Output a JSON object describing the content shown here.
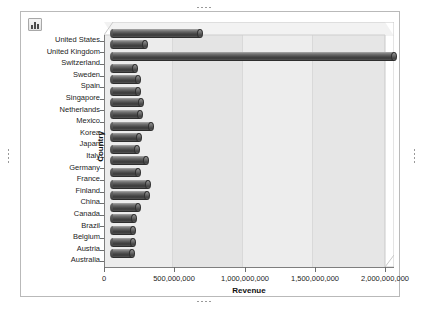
{
  "window": {
    "background_color": "#ffffff"
  },
  "toolbar": {
    "chart_type_button_name": "chart-icon",
    "chart_type_button_tooltip": "Chart"
  },
  "handles": {
    "top": "top-resize-handle",
    "bottom": "bottom-resize-handle",
    "left": "left-resize-handle",
    "right": "right-resize-handle"
  },
  "colors": {
    "bar_dark": "#3a3a3a",
    "bar_light": "#8b8b8b",
    "plot_wall": "#e8e8e8",
    "axis": "#7e7e7e",
    "frame_border": "#b9b9b9",
    "text": "#1d1d1d"
  },
  "chart_data": {
    "type": "bar",
    "orientation": "horizontal",
    "title": "",
    "xlabel": "Revenue",
    "ylabel": "Country",
    "xlim": [
      0,
      2000000000
    ],
    "grid": true,
    "legend": "none",
    "xticks": [
      0,
      500000000,
      1000000000,
      1500000000,
      2000000000
    ],
    "xtick_labels": [
      "0",
      "500,000,000",
      "1,000,000,000",
      "1,500,000,000",
      "2,000,000,000"
    ],
    "categories": [
      "United States",
      "United Kingdom",
      "Switzerland",
      "Sweden",
      "Spain",
      "Singapore",
      "Netherlands",
      "Mexico",
      "Korea",
      "Japan",
      "Italy",
      "Germany",
      "France",
      "Finland",
      "China",
      "Canada",
      "Brazil",
      "Belgium",
      "Austria",
      "Australia"
    ],
    "values": [
      620000000,
      230000000,
      2000000000,
      160000000,
      180000000,
      175000000,
      200000000,
      190000000,
      270000000,
      185000000,
      170000000,
      235000000,
      175000000,
      250000000,
      245000000,
      180000000,
      150000000,
      145000000,
      140000000,
      135000000
    ],
    "series_name": "Revenue"
  }
}
